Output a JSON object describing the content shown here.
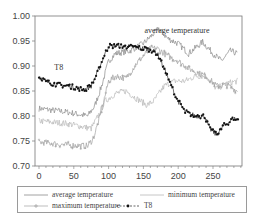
{
  "chart_data": {
    "type": "line",
    "title": "",
    "xlabel": "",
    "ylabel": "",
    "xlim": [
      0,
      292
    ],
    "ylim": [
      0.7,
      1.0
    ],
    "x_ticks": [
      0,
      50,
      100,
      150,
      200,
      250
    ],
    "y_ticks": [
      "0.70",
      "0.75",
      "0.80",
      "0.85",
      "0.90",
      "0.95",
      "1.00"
    ],
    "grid": false,
    "legend_position": "bottom",
    "annotations": [
      {
        "text": "average temperature",
        "x": 245,
        "y": 0.967
      },
      {
        "text": "T8",
        "x": 22,
        "y": 0.893
      }
    ],
    "series": [
      {
        "name": "average temperature",
        "color": "#8a8a8a",
        "style": "line",
        "keypoints": [
          [
            0,
            0.815
          ],
          [
            40,
            0.808
          ],
          [
            70,
            0.8
          ],
          [
            80,
            0.82
          ],
          [
            90,
            0.86
          ],
          [
            100,
            0.91
          ],
          [
            110,
            0.925
          ],
          [
            130,
            0.93
          ],
          [
            150,
            0.945
          ],
          [
            165,
            0.965
          ],
          [
            172,
            0.975
          ],
          [
            185,
            0.955
          ],
          [
            200,
            0.945
          ],
          [
            215,
            0.925
          ],
          [
            235,
            0.948
          ],
          [
            250,
            0.925
          ],
          [
            262,
            0.91
          ],
          [
            275,
            0.93
          ],
          [
            285,
            0.925
          ]
        ]
      },
      {
        "name": "minimum temperature",
        "color": "#b8b8b8",
        "style": "line",
        "keypoints": [
          [
            0,
            0.79
          ],
          [
            40,
            0.785
          ],
          [
            75,
            0.775
          ],
          [
            85,
            0.8
          ],
          [
            95,
            0.83
          ],
          [
            110,
            0.845
          ],
          [
            125,
            0.85
          ],
          [
            140,
            0.835
          ],
          [
            155,
            0.822
          ],
          [
            165,
            0.83
          ],
          [
            180,
            0.86
          ],
          [
            195,
            0.87
          ],
          [
            210,
            0.87
          ],
          [
            225,
            0.88
          ],
          [
            240,
            0.88
          ],
          [
            255,
            0.855
          ],
          [
            270,
            0.865
          ],
          [
            285,
            0.87
          ]
        ]
      },
      {
        "name": "maximum temperature",
        "color": "#a0a0a0",
        "style": "line-plus",
        "keypoints": [
          [
            0,
            0.748
          ],
          [
            40,
            0.742
          ],
          [
            70,
            0.74
          ],
          [
            78,
            0.755
          ],
          [
            88,
            0.8
          ],
          [
            100,
            0.87
          ],
          [
            110,
            0.88
          ],
          [
            125,
            0.875
          ],
          [
            140,
            0.905
          ],
          [
            150,
            0.92
          ],
          [
            160,
            0.935
          ],
          [
            170,
            0.935
          ],
          [
            185,
            0.92
          ],
          [
            200,
            0.91
          ],
          [
            215,
            0.895
          ],
          [
            230,
            0.885
          ],
          [
            240,
            0.88
          ],
          [
            255,
            0.86
          ],
          [
            270,
            0.862
          ],
          [
            285,
            0.85
          ]
        ]
      },
      {
        "name": "T8",
        "color": "#111111",
        "style": "dots",
        "keypoints": [
          [
            0,
            0.88
          ],
          [
            10,
            0.868
          ],
          [
            30,
            0.862
          ],
          [
            50,
            0.858
          ],
          [
            65,
            0.852
          ],
          [
            75,
            0.86
          ],
          [
            85,
            0.89
          ],
          [
            95,
            0.925
          ],
          [
            100,
            0.94
          ],
          [
            120,
            0.94
          ],
          [
            140,
            0.937
          ],
          [
            160,
            0.933
          ],
          [
            170,
            0.925
          ],
          [
            180,
            0.895
          ],
          [
            190,
            0.86
          ],
          [
            200,
            0.83
          ],
          [
            210,
            0.808
          ],
          [
            225,
            0.8
          ],
          [
            238,
            0.8
          ],
          [
            245,
            0.775
          ],
          [
            255,
            0.762
          ],
          [
            265,
            0.78
          ],
          [
            280,
            0.795
          ],
          [
            286,
            0.793
          ]
        ]
      }
    ]
  },
  "legend": {
    "items": [
      {
        "label": "average temperature"
      },
      {
        "label": "minimum temperature"
      },
      {
        "label": "maximum temperature"
      },
      {
        "label": "T8"
      }
    ]
  }
}
